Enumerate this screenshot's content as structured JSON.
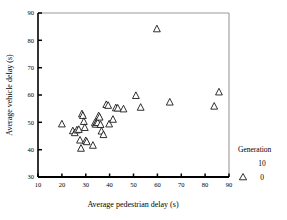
{
  "chart_data": {
    "type": "scatter",
    "title": "",
    "xlabel": "Average pedestrian delay (s)",
    "ylabel": "Average vehicle delay (s)",
    "xlim": [
      10,
      90
    ],
    "ylim": [
      30,
      90
    ],
    "xticks": [
      10,
      20,
      30,
      40,
      50,
      60,
      70,
      80,
      90
    ],
    "yticks": [
      30,
      40,
      50,
      60,
      70,
      80,
      90
    ],
    "grid": false,
    "legend_position": "right",
    "legend_title": "Generation",
    "legend_entries": [
      {
        "label": "10",
        "marker": "triangle-open",
        "shown": false
      },
      {
        "label": "0",
        "marker": "triangle-open",
        "shown": true
      }
    ],
    "marker_style": "triangle-open",
    "series": [
      {
        "name": "0",
        "points": [
          [
            20.0,
            49.5
          ],
          [
            24.6,
            47.0
          ],
          [
            25.4,
            46.3
          ],
          [
            26.3,
            47.3
          ],
          [
            27.1,
            47.5
          ],
          [
            27.6,
            43.6
          ],
          [
            28.0,
            40.6
          ],
          [
            28.4,
            53.2
          ],
          [
            28.8,
            52.6
          ],
          [
            29.2,
            50.4
          ],
          [
            29.6,
            48.2
          ],
          [
            30.0,
            43.4
          ],
          [
            30.4,
            43.0
          ],
          [
            33.0,
            41.7
          ],
          [
            33.8,
            49.9
          ],
          [
            34.2,
            49.4
          ],
          [
            34.6,
            50.2
          ],
          [
            35.0,
            50.0
          ],
          [
            35.4,
            52.5
          ],
          [
            35.8,
            52.0
          ],
          [
            36.2,
            49.3
          ],
          [
            36.6,
            46.9
          ],
          [
            37.4,
            45.6
          ],
          [
            38.6,
            56.6
          ],
          [
            39.4,
            56.3
          ],
          [
            39.8,
            49.5
          ],
          [
            41.4,
            51.2
          ],
          [
            42.6,
            55.4
          ],
          [
            43.4,
            55.3
          ],
          [
            45.8,
            55.0
          ],
          [
            51.0,
            59.9
          ],
          [
            53.0,
            55.6
          ],
          [
            59.8,
            84.3
          ],
          [
            65.2,
            57.5
          ],
          [
            83.8,
            56.0
          ],
          [
            85.8,
            61.2
          ]
        ]
      }
    ]
  }
}
